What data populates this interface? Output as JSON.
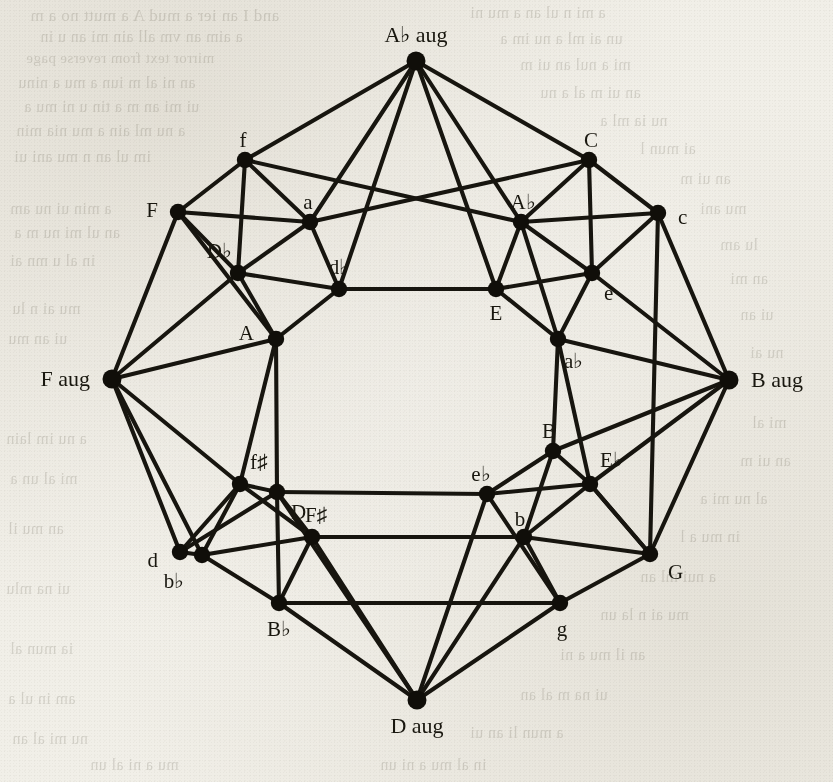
{
  "figure": {
    "type": "graph-diagram",
    "background": "#f1efe8",
    "ink_color": "#17150f",
    "width": 833,
    "height": 782
  },
  "chart_data": {
    "type": "network",
    "title": "",
    "node_count": 28,
    "edge_count": 60,
    "nodes": [
      {
        "id": "Abaug",
        "label": "A♭ aug",
        "kind": "augmented",
        "x": 416,
        "y": 61,
        "label_dx": 0,
        "label_dy": -26,
        "anchor": "center"
      },
      {
        "id": "Baug",
        "label": "B aug",
        "kind": "augmented",
        "x": 729,
        "y": 380,
        "label_dx": 22,
        "label_dy": 0,
        "anchor": "left"
      },
      {
        "id": "Daug",
        "label": "D aug",
        "kind": "augmented",
        "x": 417,
        "y": 700,
        "label_dx": 0,
        "label_dy": 26,
        "anchor": "center"
      },
      {
        "id": "Faug",
        "label": "F aug",
        "kind": "augmented",
        "x": 112,
        "y": 379,
        "label_dx": -22,
        "label_dy": 0,
        "anchor": "right"
      },
      {
        "id": "f",
        "label": "f",
        "kind": "minor",
        "x": 245,
        "y": 160,
        "label_dx": -2,
        "label_dy": -20,
        "anchor": "center"
      },
      {
        "id": "C",
        "label": "C",
        "kind": "major",
        "x": 589,
        "y": 160,
        "label_dx": 2,
        "label_dy": -20,
        "anchor": "center"
      },
      {
        "id": "F",
        "label": "F",
        "kind": "major",
        "x": 178,
        "y": 212,
        "label_dx": -20,
        "label_dy": -2,
        "anchor": "right"
      },
      {
        "id": "c",
        "label": "c",
        "kind": "minor",
        "x": 658,
        "y": 213,
        "label_dx": 20,
        "label_dy": 4,
        "anchor": "left"
      },
      {
        "id": "d",
        "label": "d",
        "kind": "minor",
        "x": 180,
        "y": 552,
        "label_dx": -22,
        "label_dy": 8,
        "anchor": "right"
      },
      {
        "id": "G",
        "label": "G",
        "kind": "major",
        "x": 650,
        "y": 554,
        "label_dx": 18,
        "label_dy": 18,
        "anchor": "left"
      },
      {
        "id": "Bb",
        "label": "B♭",
        "kind": "major",
        "x": 279,
        "y": 603,
        "label_dx": 0,
        "label_dy": 26,
        "anchor": "center"
      },
      {
        "id": "g",
        "label": "g",
        "kind": "minor",
        "x": 560,
        "y": 603,
        "label_dx": 2,
        "label_dy": 26,
        "anchor": "center"
      },
      {
        "id": "a",
        "label": "a",
        "kind": "minor",
        "x": 310,
        "y": 222,
        "label_dx": -2,
        "label_dy": -20,
        "anchor": "center"
      },
      {
        "id": "Ab",
        "label": "A♭",
        "kind": "major",
        "x": 521,
        "y": 222,
        "label_dx": 2,
        "label_dy": -20,
        "anchor": "center"
      },
      {
        "id": "Db",
        "label": "D♭",
        "kind": "major",
        "x": 238,
        "y": 273,
        "label_dx": -6,
        "label_dy": -22,
        "anchor": "right"
      },
      {
        "id": "e",
        "label": "e",
        "kind": "minor",
        "x": 592,
        "y": 273,
        "label_dx": 12,
        "label_dy": 20,
        "anchor": "left"
      },
      {
        "id": "fs",
        "label": "f♯",
        "kind": "minor",
        "x": 240,
        "y": 484,
        "label_dx": 10,
        "label_dy": -22,
        "anchor": "left"
      },
      {
        "id": "Eb",
        "label": "E♭",
        "kind": "major",
        "x": 590,
        "y": 484,
        "label_dx": 10,
        "label_dy": -24,
        "anchor": "left"
      },
      {
        "id": "Fs",
        "label": "F♯",
        "kind": "major",
        "x": 312,
        "y": 537,
        "label_dx": 4,
        "label_dy": -22,
        "anchor": "center"
      },
      {
        "id": "b",
        "label": "b",
        "kind": "minor",
        "x": 524,
        "y": 537,
        "label_dx": -4,
        "label_dy": -18,
        "anchor": "center"
      },
      {
        "id": "bb",
        "label": "b♭",
        "kind": "minor",
        "x": 202,
        "y": 555,
        "label_dx": -28,
        "label_dy": 26,
        "anchor": "center"
      },
      {
        "id": "db",
        "label": "d♭",
        "kind": "minor",
        "x": 339,
        "y": 289,
        "label_dx": 0,
        "label_dy": -22,
        "anchor": "center"
      },
      {
        "id": "E",
        "label": "E",
        "kind": "major",
        "x": 496,
        "y": 289,
        "label_dx": 0,
        "label_dy": 24,
        "anchor": "center"
      },
      {
        "id": "A",
        "label": "A",
        "kind": "major",
        "x": 276,
        "y": 339,
        "label_dx": -22,
        "label_dy": -6,
        "anchor": "right"
      },
      {
        "id": "ab",
        "label": "a♭",
        "kind": "minor",
        "x": 558,
        "y": 339,
        "label_dx": 6,
        "label_dy": 22,
        "anchor": "left"
      },
      {
        "id": "D",
        "label": "D",
        "kind": "major",
        "x": 277,
        "y": 492,
        "label_dx": 14,
        "label_dy": 20,
        "anchor": "left"
      },
      {
        "id": "B",
        "label": "B",
        "kind": "major",
        "x": 553,
        "y": 451,
        "label_dx": -4,
        "label_dy": -20,
        "anchor": "center"
      },
      {
        "id": "eb",
        "label": "e♭",
        "kind": "minor",
        "x": 487,
        "y": 494,
        "label_dx": -6,
        "label_dy": -20,
        "anchor": "center"
      }
    ],
    "edges": [
      [
        "Abaug",
        "f"
      ],
      [
        "Abaug",
        "a"
      ],
      [
        "Abaug",
        "C"
      ],
      [
        "Abaug",
        "Ab"
      ],
      [
        "Abaug",
        "db"
      ],
      [
        "Abaug",
        "E"
      ],
      [
        "Daug",
        "Bb"
      ],
      [
        "Daug",
        "g"
      ],
      [
        "Daug",
        "Fs"
      ],
      [
        "Daug",
        "b"
      ],
      [
        "Daug",
        "D"
      ],
      [
        "Daug",
        "eb"
      ],
      [
        "Faug",
        "F"
      ],
      [
        "Faug",
        "Db"
      ],
      [
        "Faug",
        "A"
      ],
      [
        "Faug",
        "d"
      ],
      [
        "Faug",
        "bb"
      ],
      [
        "Faug",
        "fs"
      ],
      [
        "Baug",
        "c"
      ],
      [
        "Baug",
        "e"
      ],
      [
        "Baug",
        "ab"
      ],
      [
        "Baug",
        "B"
      ],
      [
        "Baug",
        "Eb"
      ],
      [
        "Baug",
        "G"
      ],
      [
        "f",
        "F"
      ],
      [
        "f",
        "a"
      ],
      [
        "f",
        "Db"
      ],
      [
        "f",
        "Ab"
      ],
      [
        "C",
        "c"
      ],
      [
        "C",
        "Ab"
      ],
      [
        "C",
        "a"
      ],
      [
        "C",
        "e"
      ],
      [
        "F",
        "Db"
      ],
      [
        "F",
        "a"
      ],
      [
        "F",
        "A"
      ],
      [
        "c",
        "e"
      ],
      [
        "c",
        "Ab"
      ],
      [
        "c",
        "G"
      ],
      [
        "a",
        "db"
      ],
      [
        "a",
        "Db"
      ],
      [
        "Ab",
        "ab"
      ],
      [
        "Ab",
        "E"
      ],
      [
        "Ab",
        "e"
      ],
      [
        "Db",
        "db"
      ],
      [
        "Db",
        "A"
      ],
      [
        "e",
        "ab"
      ],
      [
        "e",
        "E"
      ],
      [
        "db",
        "E"
      ],
      [
        "db",
        "A"
      ],
      [
        "E",
        "ab"
      ],
      [
        "A",
        "D"
      ],
      [
        "A",
        "fs"
      ],
      [
        "ab",
        "B"
      ],
      [
        "ab",
        "Eb"
      ],
      [
        "D",
        "fs"
      ],
      [
        "D",
        "Fs"
      ],
      [
        "D",
        "eb"
      ],
      [
        "B",
        "eb"
      ],
      [
        "B",
        "Eb"
      ],
      [
        "B",
        "b"
      ],
      [
        "fs",
        "bb"
      ],
      [
        "fs",
        "Fs"
      ],
      [
        "Eb",
        "b"
      ],
      [
        "Eb",
        "G"
      ],
      [
        "Fs",
        "bb"
      ],
      [
        "Fs",
        "Bb"
      ],
      [
        "Fs",
        "b"
      ],
      [
        "b",
        "g"
      ],
      [
        "b",
        "G"
      ],
      [
        "bb",
        "d"
      ],
      [
        "bb",
        "Bb"
      ],
      [
        "d",
        "D"
      ],
      [
        "d",
        "fs"
      ],
      [
        "G",
        "g"
      ],
      [
        "G",
        "Eb"
      ],
      [
        "Bb",
        "g"
      ],
      [
        "Bb",
        "D"
      ],
      [
        "eb",
        "g"
      ],
      [
        "eb",
        "Eb"
      ]
    ],
    "legend": []
  },
  "bleed_text": {
    "lines": [
      {
        "t": "and I an ier a mud A a mutt no a m",
        "x": 30,
        "y": 6,
        "s": 17
      },
      {
        "t": "a aim an vm all ain mi an u in",
        "x": 40,
        "y": 28,
        "s": 16
      },
      {
        "t": "mirror text from reverse page",
        "x": 26,
        "y": 50,
        "s": 15
      },
      {
        "t": "an ni al m iun a mu a ninu",
        "x": 18,
        "y": 74,
        "s": 16
      },
      {
        "t": "ui mi an m a tin u ni mu a",
        "x": 24,
        "y": 98,
        "s": 16
      },
      {
        "t": "a nu ml ain a mu nia min",
        "x": 16,
        "y": 122,
        "s": 16
      },
      {
        "t": "im ul an n mu ani ui",
        "x": 14,
        "y": 148,
        "s": 16
      },
      {
        "t": "a min ui nu am",
        "x": 10,
        "y": 200,
        "s": 16
      },
      {
        "t": "an ul mi nu m a",
        "x": 14,
        "y": 224,
        "s": 16
      },
      {
        "t": "in al u mn ai",
        "x": 10,
        "y": 252,
        "s": 16
      },
      {
        "t": "mu ai n lu",
        "x": 12,
        "y": 300,
        "s": 16
      },
      {
        "t": "ui an mu",
        "x": 8,
        "y": 330,
        "s": 16
      },
      {
        "t": "a nu im lain",
        "x": 6,
        "y": 430,
        "s": 16
      },
      {
        "t": "mi al un a",
        "x": 10,
        "y": 470,
        "s": 16
      },
      {
        "t": "an mu il",
        "x": 8,
        "y": 520,
        "s": 16
      },
      {
        "t": "ui na mlu",
        "x": 6,
        "y": 580,
        "s": 16
      },
      {
        "t": "ia mun al",
        "x": 10,
        "y": 640,
        "s": 16
      },
      {
        "t": "am in ul a",
        "x": 8,
        "y": 690,
        "s": 16
      },
      {
        "t": "nu mi al an",
        "x": 12,
        "y": 730,
        "s": 16
      },
      {
        "t": "a mi n ul an a mu ni",
        "x": 470,
        "y": 4,
        "s": 16
      },
      {
        "t": "un ai ml a nu im a",
        "x": 500,
        "y": 30,
        "s": 16
      },
      {
        "t": "mi a nul an ui m",
        "x": 520,
        "y": 56,
        "s": 16
      },
      {
        "t": "an ui m al a nu",
        "x": 540,
        "y": 84,
        "s": 16
      },
      {
        "t": "nu ia ml a",
        "x": 600,
        "y": 112,
        "s": 16
      },
      {
        "t": "ai mun l",
        "x": 640,
        "y": 140,
        "s": 16
      },
      {
        "t": "an ui m",
        "x": 680,
        "y": 170,
        "s": 16
      },
      {
        "t": "mu ani",
        "x": 700,
        "y": 200,
        "s": 16
      },
      {
        "t": "lu am",
        "x": 720,
        "y": 236,
        "s": 16
      },
      {
        "t": "an mi",
        "x": 730,
        "y": 270,
        "s": 16
      },
      {
        "t": "ui an",
        "x": 740,
        "y": 306,
        "s": 16
      },
      {
        "t": "nu ai",
        "x": 750,
        "y": 344,
        "s": 16
      },
      {
        "t": "mi al",
        "x": 752,
        "y": 414,
        "s": 16
      },
      {
        "t": "an ui m",
        "x": 740,
        "y": 452,
        "s": 16
      },
      {
        "t": "al nu mi a",
        "x": 700,
        "y": 490,
        "s": 16
      },
      {
        "t": "in mu a l",
        "x": 680,
        "y": 528,
        "s": 16
      },
      {
        "t": "a nui ml an",
        "x": 640,
        "y": 568,
        "s": 16
      },
      {
        "t": "mu ai n la un",
        "x": 600,
        "y": 606,
        "s": 16
      },
      {
        "t": "an il mu a ni",
        "x": 560,
        "y": 646,
        "s": 16
      },
      {
        "t": "ui na m al an",
        "x": 520,
        "y": 686,
        "s": 16
      },
      {
        "t": "a mun li an ui",
        "x": 470,
        "y": 724,
        "s": 16
      },
      {
        "t": "in al mu a ni un",
        "x": 380,
        "y": 756,
        "s": 16
      },
      {
        "t": "mu a ni al un",
        "x": 90,
        "y": 756,
        "s": 16
      }
    ]
  }
}
